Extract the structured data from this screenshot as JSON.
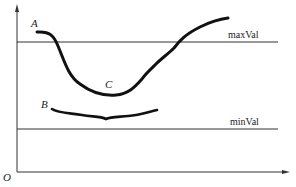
{
  "diagram": {
    "origin_label": "O",
    "thresholds": [
      {
        "name": "max",
        "label": "maxVal",
        "y": 42
      },
      {
        "name": "min",
        "label": "minVal",
        "y": 129
      }
    ],
    "curves": [
      {
        "name": "A",
        "label": "A",
        "point_label": "C",
        "description": "curve starting above maxVal, dipping below it to minimum C, then rising above maxVal"
      },
      {
        "name": "B",
        "label": "B",
        "description": "nearly flat curve between maxVal and minVal"
      }
    ],
    "colors": {
      "line": "#222222",
      "curve": "#111111",
      "text": "#222222"
    }
  }
}
